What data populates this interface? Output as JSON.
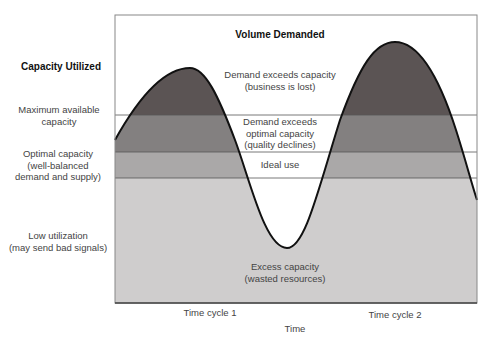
{
  "diagram": {
    "title_y": "Capacity Utilized",
    "curve_label": "Volume Demanded",
    "x_axis_label": "Time",
    "x_ticks": [
      "Time cycle 1",
      "Time cycle 2"
    ],
    "y_levels": [
      {
        "label": "Maximum available capacity",
        "line1": "Maximum available",
        "line2": "capacity"
      },
      {
        "label": "Optimal capacity (well-balanced demand and supply)",
        "line1": "Optimal capacity",
        "line2": "(well-balanced",
        "line3": "demand and supply)"
      },
      {
        "label": "Low utilization (may send bad signals)",
        "line1": "Low utilization",
        "line2": "(may send bad signals)"
      }
    ],
    "zones": [
      {
        "name": "demand-exceeds-capacity",
        "line1": "Demand exceeds capacity",
        "line2": "(business is lost)",
        "color": "#5b5454"
      },
      {
        "name": "demand-exceeds-optimal",
        "line1": "Demand exceeds",
        "line2": "optimal capacity",
        "line3": "(quality declines)",
        "color": "#838080"
      },
      {
        "name": "ideal-use",
        "line1": "Ideal use",
        "color": "#aaa8a8"
      },
      {
        "name": "excess-capacity",
        "line1": "Excess capacity",
        "line2": "(wasted resources)",
        "color": "#cfcdcd"
      }
    ],
    "colors": {
      "frame": "#888888",
      "curve": "#111111",
      "band_line": "#555555",
      "background": "#ffffff"
    }
  }
}
